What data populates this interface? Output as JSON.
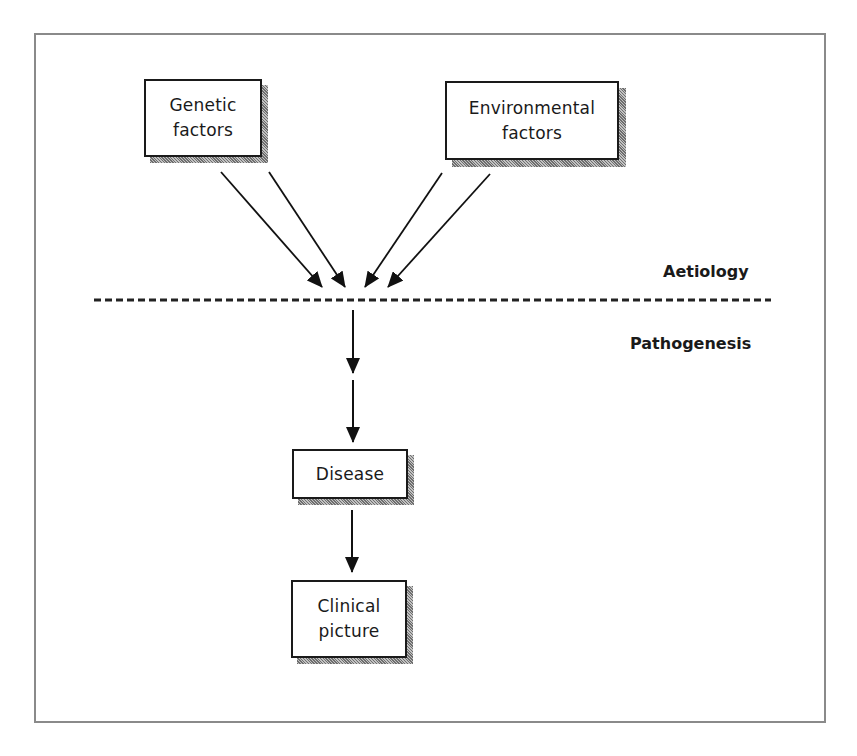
{
  "diagram": {
    "nodes": {
      "genetic": {
        "label": "Genetic\nfactors"
      },
      "environmental": {
        "label": "Environmental\nfactors"
      },
      "disease": {
        "label": "Disease"
      },
      "clinical": {
        "label": "Clinical\npicture"
      }
    },
    "section_labels": {
      "aetiology": "Aetiology",
      "pathogenesis": "Pathogenesis"
    },
    "edges": [
      {
        "from": "genetic",
        "to": "convergence"
      },
      {
        "from": "genetic",
        "to": "convergence"
      },
      {
        "from": "environmental",
        "to": "convergence"
      },
      {
        "from": "environmental",
        "to": "convergence"
      },
      {
        "from": "convergence",
        "to": "intermediate"
      },
      {
        "from": "intermediate",
        "to": "disease"
      },
      {
        "from": "disease",
        "to": "clinical"
      }
    ],
    "divider": {
      "style": "dashed",
      "separates": [
        "Aetiology",
        "Pathogenesis"
      ]
    }
  }
}
